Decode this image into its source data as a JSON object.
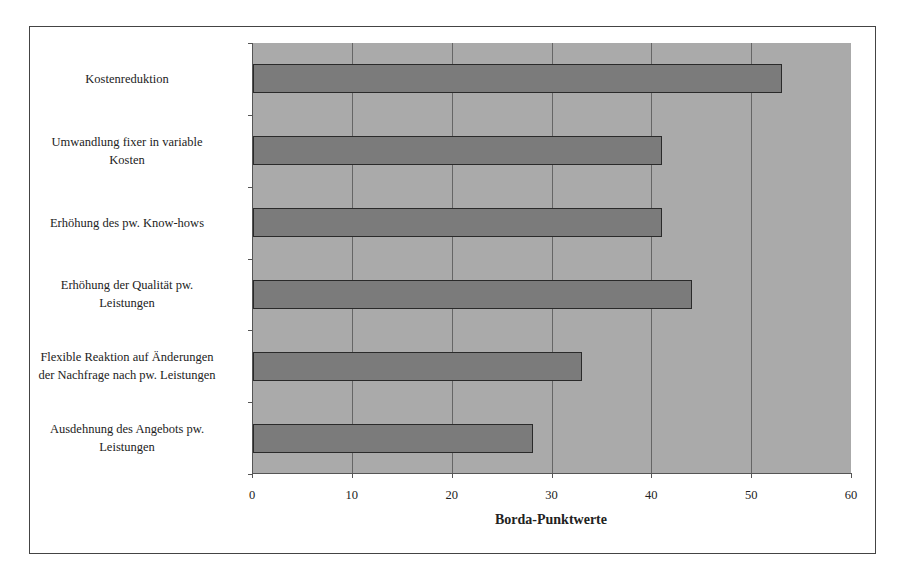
{
  "chart_data": {
    "type": "bar",
    "orientation": "horizontal",
    "title": "",
    "xlabel": "Borda-Punktwerte",
    "ylabel": "",
    "xlim": [
      0,
      60
    ],
    "xticks": [
      "0",
      "10",
      "20",
      "30",
      "40",
      "50",
      "60"
    ],
    "grid": true,
    "legend": null,
    "categories": [
      "Kostenreduktion",
      "Umwandlung fixer in variable\nKosten",
      "Erhöhung des pw. Know-hows",
      "Erhöhung der Qualität pw.\nLeistungen",
      "Flexible Reaktion auf Änderungen\nder Nachfrage nach pw. Leistungen",
      "Ausdehnung des Angebots pw.\nLeistungen"
    ],
    "values": [
      53,
      41,
      41,
      44,
      33,
      28
    ],
    "colors": {
      "bar": "#7b7b7b",
      "plot_background": "#aaaaaa",
      "bar_border": "#2a2a2a"
    }
  }
}
